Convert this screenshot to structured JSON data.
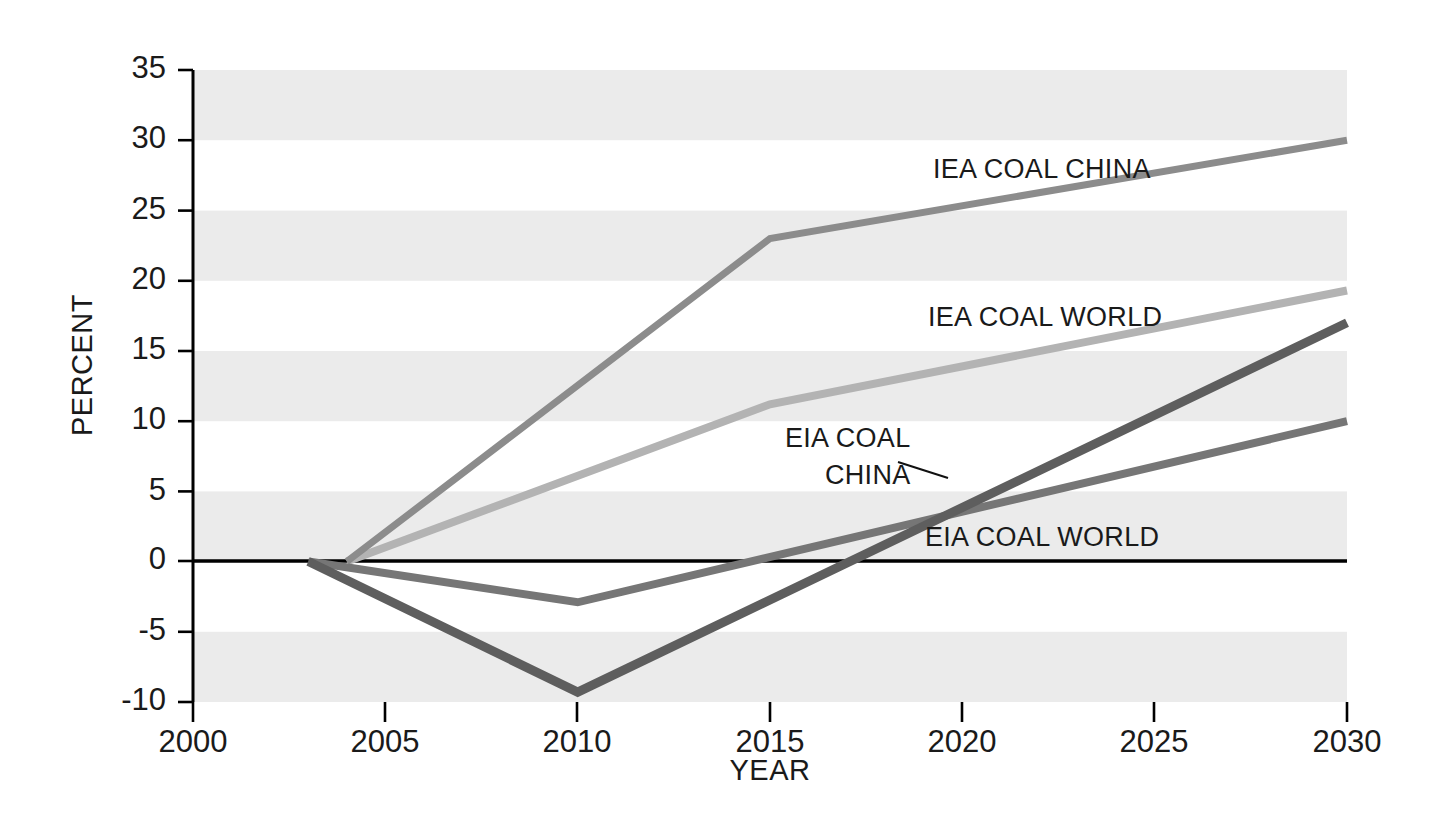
{
  "chart_data": {
    "type": "line",
    "title": "",
    "xlabel": "YEAR",
    "ylabel": "PERCENT",
    "xlim": [
      2000,
      2030
    ],
    "ylim": [
      -10,
      35
    ],
    "grid": "horizontal-shaded-bands",
    "legend": "inline-labels",
    "x_ticks": [
      "2000",
      "2005",
      "2010",
      "2015",
      "2020",
      "2025",
      "2030"
    ],
    "y_ticks": [
      "35",
      "30",
      "25",
      "20",
      "15",
      "10",
      "5",
      "0",
      "-5",
      "-10"
    ],
    "series": [
      {
        "name": "IEA COAL CHINA",
        "color": "#8c8c8c",
        "x": [
          2004,
          2015,
          2030
        ],
        "values": [
          0,
          23,
          30
        ]
      },
      {
        "name": "IEA COAL WORLD",
        "color": "#b3b3b3",
        "x": [
          2004,
          2015,
          2030
        ],
        "values": [
          0,
          11.2,
          19.3
        ]
      },
      {
        "name": "EIA COAL CHINA",
        "color": "#5e5e5e",
        "x": [
          2003,
          2010,
          2030
        ],
        "values": [
          0,
          -9.3,
          17
        ]
      },
      {
        "name": "EIA COAL WORLD",
        "color": "#767676",
        "x": [
          2003,
          2010,
          2030
        ],
        "values": [
          0,
          -2.9,
          10
        ]
      }
    ],
    "annotations": [
      {
        "text": "IEA COAL CHINA",
        "x": 933,
        "y": 168
      },
      {
        "text": "IEA COAL WORLD",
        "x": 928,
        "y": 317
      },
      {
        "text": "EIA COAL",
        "x": 787,
        "y": 437
      },
      {
        "text": "CHINA",
        "x": 824,
        "y": 474
      },
      {
        "text": "EIA COAL WORLD",
        "x": 925,
        "y": 537
      }
    ]
  },
  "axes": {
    "y_label": "PERCENT",
    "x_label": "YEAR",
    "y_ticks": [
      "35",
      "30",
      "25",
      "20",
      "15",
      "10",
      "5",
      "0",
      "-5",
      "-10"
    ],
    "x_ticks": [
      "2000",
      "2005",
      "2010",
      "2015",
      "2020",
      "2025",
      "2030"
    ]
  },
  "labels": {
    "iea_coal_china": "IEA COAL CHINA",
    "iea_coal_world": "IEA COAL WORLD",
    "eia_coal_line1": "EIA COAL",
    "eia_coal_line2": "CHINA",
    "eia_coal_world": "EIA COAL WORLD"
  },
  "colors": {
    "band": "#ebebeb",
    "axis": "#000000",
    "iea_coal_china": "#8c8c8c",
    "iea_coal_world": "#b3b3b3",
    "eia_coal_china": "#5e5e5e",
    "eia_coal_world": "#767676"
  }
}
